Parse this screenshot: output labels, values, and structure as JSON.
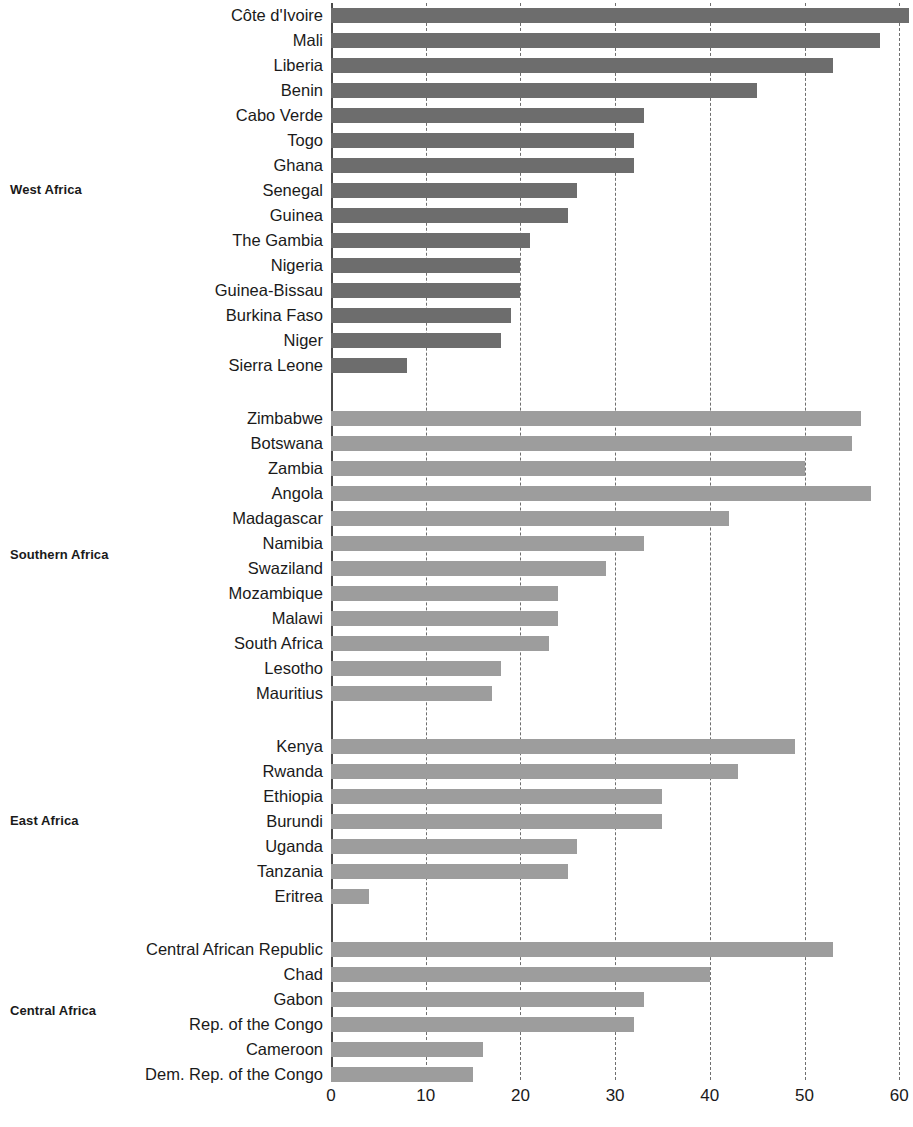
{
  "chart_data": {
    "type": "bar",
    "orientation": "horizontal",
    "title": "",
    "subtitle": "",
    "xlabel": "",
    "ylabel": "",
    "xlim": [
      0,
      60.8
    ],
    "xticks": [
      0,
      10,
      20,
      30,
      40,
      50,
      60
    ],
    "xtick_labels": [
      "0",
      "10",
      "20",
      "30",
      "40",
      "50",
      "60"
    ],
    "grid": "vertical-dashed",
    "legend": "none",
    "bar_colors": {
      "west": "#6d6d6d",
      "other": "#9d9d9d"
    },
    "groups": [
      {
        "name": "West Africa",
        "color_key": "west",
        "categories": [
          "Côte d'Ivoire",
          "Mali",
          "Liberia",
          "Benin",
          "Cabo Verde",
          "Togo",
          "Ghana",
          "Senegal",
          "Guinea",
          "The Gambia",
          "Nigeria",
          "Guinea-Bissau",
          "Burkina Faso",
          "Niger",
          "Sierra Leone"
        ],
        "values": [
          61,
          58,
          53,
          45,
          33,
          32,
          32,
          26,
          25,
          21,
          20,
          20,
          19,
          18,
          8
        ]
      },
      {
        "name": "Southern Africa",
        "color_key": "other",
        "categories": [
          "Zimbabwe",
          "Botswana",
          "Zambia",
          "Angola",
          "Madagascar",
          "Namibia",
          "Swaziland",
          "Mozambique",
          "Malawi",
          "South Africa",
          "Lesotho",
          "Mauritius"
        ],
        "values": [
          56,
          55,
          50,
          57,
          42,
          33,
          29,
          24,
          24,
          23,
          18,
          17
        ]
      },
      {
        "name": "East Africa",
        "color_key": "other",
        "categories": [
          "Kenya",
          "Rwanda",
          "Ethiopia",
          "Burundi",
          "Uganda",
          "Tanzania",
          "Eritrea"
        ],
        "values": [
          49,
          43,
          35,
          35,
          26,
          25,
          4
        ]
      },
      {
        "name": "Central Africa",
        "color_key": "other",
        "categories": [
          "Central African Republic",
          "Chad",
          "Gabon",
          "Rep. of the Congo",
          "Cameroon",
          "Dem. Rep. of the Congo"
        ],
        "values": [
          53,
          40,
          33,
          32,
          16,
          15
        ]
      }
    ]
  }
}
